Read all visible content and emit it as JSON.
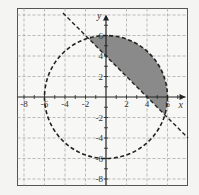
{
  "chart_data": {
    "type": "diagram",
    "title": "",
    "xlabel": "x",
    "ylabel": "y",
    "xlim": [
      -8.7,
      8
    ],
    "ylim": [
      -8.6,
      8.6
    ],
    "grid": true,
    "grid_style": "dashed",
    "grid_step": 2,
    "x_ticks": [
      "-8",
      "-6",
      "-4",
      "-2",
      "2",
      "4",
      "6"
    ],
    "y_ticks": [
      "6",
      "4",
      "2",
      "-2",
      "-4",
      "-6",
      "-8"
    ],
    "curves": [
      {
        "name": "circle",
        "equation": "x^2 + y^2 = 36",
        "center": [
          0,
          0
        ],
        "radius": 6,
        "style": "dashed"
      },
      {
        "name": "line",
        "equation": "y = -x + 4",
        "slope": -1,
        "intercept": 4,
        "style": "dashed"
      }
    ],
    "shaded_region": {
      "description": "inside circle and above line",
      "inequalities": [
        "x^2 + y^2 < 36",
        "y > -x + 4"
      ],
      "color": "#8a8a8a"
    }
  },
  "labels": {
    "x_axis": "x",
    "y_axis": "y",
    "ticks_x": [
      {
        "v": -8,
        "t": "-8"
      },
      {
        "v": -6,
        "t": "-6"
      },
      {
        "v": -4,
        "t": "-4"
      },
      {
        "v": -2,
        "t": "-2"
      },
      {
        "v": 2,
        "t": "2"
      },
      {
        "v": 4,
        "t": "4"
      },
      {
        "v": 6,
        "t": "6"
      }
    ],
    "ticks_y": [
      {
        "v": 6,
        "t": "6"
      },
      {
        "v": 4,
        "t": "4"
      },
      {
        "v": 2,
        "t": "2"
      },
      {
        "v": -2,
        "t": "-2"
      },
      {
        "v": -4,
        "t": "-4"
      },
      {
        "v": -6,
        "t": "-6"
      },
      {
        "v": -8,
        "t": "-8"
      }
    ]
  }
}
